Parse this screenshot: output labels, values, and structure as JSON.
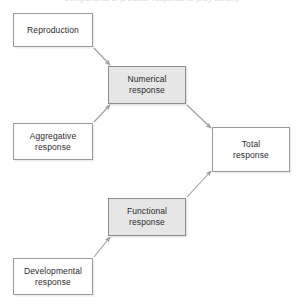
{
  "figure": {
    "title": "Components of predator response to prey density",
    "clipped_caption_note": "partially cut-off caption text at top edge",
    "background_color": "#ffffff",
    "node_border_color": "#9a9a9a",
    "shaded_fill_color": "#e6e6e6",
    "plain_fill_color": "#ffffff",
    "arrow_color": "#9a9a9a",
    "text_color": "#2b2b2b"
  },
  "nodes": [
    {
      "id": "reproduction",
      "label": "Reproduction",
      "style": "plain",
      "x": 13,
      "y": 13,
      "width": 80,
      "height": 34
    },
    {
      "id": "numerical",
      "label": "Numerical\nresponse",
      "style": "shaded",
      "x": 108,
      "y": 66,
      "width": 78,
      "height": 38
    },
    {
      "id": "aggregative",
      "label": "Aggregative\nresponse",
      "style": "plain",
      "x": 13,
      "y": 123,
      "width": 80,
      "height": 37
    },
    {
      "id": "total",
      "label": "Total\nresponse",
      "style": "plain",
      "x": 212,
      "y": 127,
      "width": 78,
      "height": 45
    },
    {
      "id": "functional",
      "label": "Functional\nresponse",
      "style": "shaded",
      "x": 108,
      "y": 198,
      "width": 78,
      "height": 38
    },
    {
      "id": "developmental",
      "label": "Developmental\nresponse",
      "style": "plain",
      "x": 13,
      "y": 258,
      "width": 80,
      "height": 37
    }
  ],
  "edges": [
    {
      "id": "reproduction-to-numerical",
      "from": "reproduction",
      "to": "numerical",
      "from_point": [
        94,
        48
      ],
      "to_point": [
        110,
        65
      ],
      "arrowhead": "to"
    },
    {
      "id": "aggregative-to-numerical",
      "from": "aggregative",
      "to": "numerical",
      "from_point": [
        94,
        122
      ],
      "to_point": [
        110,
        105
      ],
      "arrowhead": "to"
    },
    {
      "id": "numerical-to-total",
      "from": "numerical",
      "to": "total",
      "from_point": [
        187,
        105
      ],
      "to_point": [
        211,
        128
      ],
      "arrowhead": "to"
    },
    {
      "id": "developmental-to-functional",
      "from": "developmental",
      "to": "functional",
      "from_point": [
        94,
        257
      ],
      "to_point": [
        110,
        237
      ],
      "arrowhead": "to"
    },
    {
      "id": "functional-to-total",
      "from": "functional",
      "to": "total",
      "from_point": [
        187,
        197
      ],
      "to_point": [
        211,
        171
      ],
      "arrowhead": "to"
    }
  ]
}
